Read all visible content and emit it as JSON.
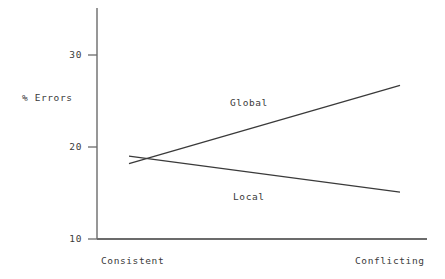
{
  "chart_data": {
    "type": "line",
    "title": "",
    "xlabel": "",
    "ylabel": "% Errors",
    "categories": [
      "Consistent",
      "Conflicting"
    ],
    "x": [
      0,
      1
    ],
    "xlim": [
      0,
      1
    ],
    "ylim": [
      10,
      34
    ],
    "yticks": [
      10,
      20,
      30
    ],
    "ytick_labels": [
      "10",
      "20",
      "30"
    ],
    "grid": false,
    "legend_position": "inline-annotations",
    "series": [
      {
        "name": "Global",
        "values": [
          18.2,
          26.7
        ],
        "label": "Global",
        "color": "#3a3a3a"
      },
      {
        "name": "Local",
        "values": [
          19.0,
          15.1
        ],
        "label": "Local",
        "color": "#3a3a3a"
      }
    ],
    "annotations": [
      {
        "text": "Global",
        "x": 0.37,
        "y": 24.3
      },
      {
        "text": "Local",
        "x": 0.38,
        "y": 14.9
      }
    ]
  },
  "axes": {
    "y_title": "% Errors",
    "y_ticks": [
      {
        "label": "30",
        "value": 30
      },
      {
        "label": "20",
        "value": 20
      },
      {
        "label": "10",
        "value": 10
      }
    ],
    "x_ticks": [
      {
        "label": "Consistent",
        "value": 0
      },
      {
        "label": "Conflicting",
        "value": 1
      }
    ]
  },
  "series_labels": {
    "global": "Global",
    "local": "Local"
  },
  "colors": {
    "line": "#3a3a3a",
    "axis": "#6b6b6b",
    "text": "#3a3a3a",
    "background": "#ffffff"
  }
}
